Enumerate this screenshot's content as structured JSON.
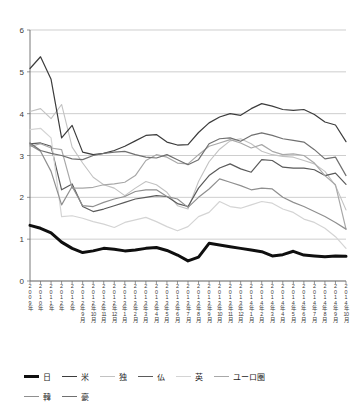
{
  "chart_data": {
    "type": "line",
    "title": "",
    "subtitle": "",
    "xlabel": "",
    "ylabel": "",
    "ylim": [
      0,
      6
    ],
    "yticks": [
      "0",
      "1",
      "2",
      "3",
      "4",
      "5",
      "6"
    ],
    "grid": true,
    "legend_position": "bottom",
    "categories": [
      "2009年",
      "2010年",
      "2011年",
      "2012年",
      "2013年",
      "2012年9月",
      "2012年10月",
      "2012年11月",
      "2012年12月",
      "2013年1月",
      "2013年2月",
      "2013年3月",
      "2013年4月",
      "2013年5月",
      "2013年6月",
      "2013年7月",
      "2013年8月",
      "2013年9月",
      "2013年10月",
      "2013年11月",
      "2013年12月",
      "2014年1月",
      "2014年2月",
      "2014年3月",
      "2014年4月",
      "2014年5月",
      "2014年6月",
      "2014年7月",
      "2014年8月",
      "2014年9月",
      "2014年10月"
    ],
    "series": [
      {
        "name": "日",
        "color": "#0f0f0f",
        "width": 3.0,
        "values": [
          1.33,
          1.26,
          1.15,
          0.93,
          0.78,
          0.68,
          0.72,
          0.78,
          0.76,
          0.72,
          0.74,
          0.78,
          0.8,
          0.73,
          0.62,
          0.48,
          0.57,
          0.9,
          0.86,
          0.82,
          0.78,
          0.74,
          0.7,
          0.6,
          0.63,
          0.71,
          0.62,
          0.6,
          0.58,
          0.6,
          0.59
        ]
      },
      {
        "name": "米",
        "color": "#3c3c3c",
        "width": 1.2,
        "values": [
          5.08,
          5.36,
          4.82,
          3.42,
          3.72,
          3.08,
          3.02,
          3.05,
          3.12,
          3.22,
          3.35,
          3.48,
          3.5,
          3.32,
          3.25,
          3.26,
          3.55,
          3.78,
          3.92,
          4.0,
          3.96,
          4.12,
          4.24,
          4.18,
          4.1,
          4.08,
          4.1,
          3.98,
          3.8,
          3.73,
          3.33
        ]
      },
      {
        "name": "独",
        "color": "#c2c2c2",
        "width": 1.1,
        "values": [
          4.05,
          4.12,
          3.88,
          4.22,
          3.2,
          2.82,
          2.48,
          2.3,
          2.22,
          2.04,
          2.22,
          2.38,
          2.3,
          2.12,
          1.8,
          1.72,
          2.38,
          2.85,
          3.15,
          3.35,
          3.4,
          3.28,
          3.1,
          3.02,
          2.98,
          2.96,
          2.88,
          2.8,
          2.62,
          2.28,
          1.7
        ]
      },
      {
        "name": "仏",
        "color": "#5a5a5a",
        "width": 1.2,
        "values": [
          3.28,
          3.3,
          3.22,
          2.18,
          2.32,
          1.78,
          1.66,
          1.72,
          1.8,
          1.88,
          1.96,
          2.0,
          2.04,
          2.02,
          1.85,
          1.78,
          2.22,
          2.52,
          2.7,
          2.8,
          2.68,
          2.6,
          2.9,
          2.88,
          2.72,
          2.7,
          2.7,
          2.66,
          2.52,
          2.58,
          2.31
        ]
      },
      {
        "name": "英",
        "color": "#d4d4d4",
        "width": 1.2,
        "values": [
          3.62,
          3.65,
          3.42,
          1.54,
          1.56,
          1.5,
          1.42,
          1.36,
          1.28,
          1.4,
          1.46,
          1.52,
          1.42,
          1.3,
          1.2,
          1.3,
          1.54,
          1.64,
          1.9,
          1.78,
          1.74,
          1.82,
          1.9,
          1.86,
          1.72,
          1.64,
          1.48,
          1.4,
          1.26,
          1.06,
          0.78
        ]
      },
      {
        "name": "ユーロ圏",
        "color": "#a8a8a8",
        "width": 1.2,
        "values": [
          3.22,
          3.28,
          3.18,
          3.14,
          2.22,
          2.22,
          2.24,
          2.3,
          2.32,
          2.36,
          2.52,
          2.88,
          3.02,
          2.96,
          2.82,
          2.8,
          3.02,
          3.22,
          3.3,
          3.38,
          3.3,
          3.18,
          3.26,
          3.1,
          3.02,
          3.04,
          3.0,
          2.82,
          2.52,
          2.3,
          1.24
        ]
      },
      {
        "name": "韓",
        "color": "#8f8f8f",
        "width": 1.2,
        "values": [
          3.25,
          3.1,
          2.62,
          1.82,
          2.26,
          1.8,
          1.78,
          1.88,
          1.96,
          2.02,
          2.14,
          2.18,
          2.18,
          2.02,
          1.96,
          1.76,
          2.0,
          2.2,
          2.44,
          2.36,
          2.28,
          2.18,
          2.22,
          2.2,
          2.0,
          1.88,
          1.78,
          1.66,
          1.54,
          1.4,
          1.24
        ]
      },
      {
        "name": "豪",
        "color": "#707070",
        "width": 1.2,
        "values": [
          3.3,
          3.12,
          3.05,
          3.0,
          2.92,
          2.9,
          3.0,
          3.05,
          3.08,
          3.1,
          3.02,
          2.96,
          2.94,
          3.02,
          2.9,
          2.78,
          2.9,
          3.28,
          3.4,
          3.42,
          3.34,
          3.48,
          3.54,
          3.48,
          3.4,
          3.36,
          3.32,
          3.14,
          2.92,
          2.96,
          2.52
        ]
      }
    ]
  },
  "legend": {
    "rows": [
      [
        {
          "label": "日",
          "color": "#0f0f0f",
          "width": 3.0
        },
        {
          "label": "米",
          "color": "#3c3c3c",
          "width": 1.6
        },
        {
          "label": "独",
          "color": "#c2c2c2",
          "width": 1.4
        },
        {
          "label": "仏",
          "color": "#5a5a5a",
          "width": 1.6
        },
        {
          "label": "英",
          "color": "#d4d4d4",
          "width": 1.4
        },
        {
          "label": "ユーロ圏",
          "color": "#a8a8a8",
          "width": 1.4
        }
      ],
      [
        {
          "label": "韓",
          "color": "#8f8f8f",
          "width": 1.4
        },
        {
          "label": "豪",
          "color": "#707070",
          "width": 1.6
        }
      ]
    ]
  }
}
